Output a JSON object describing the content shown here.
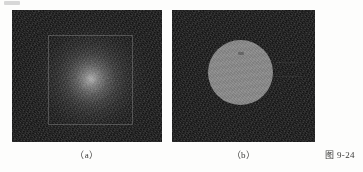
{
  "figure": {
    "number_label": "图 9-24",
    "panels": [
      {
        "id": "a",
        "caption": "（a）",
        "description": "noisy dark image with central radial bright blob and thin square outline",
        "background_color": "#1b1b1b",
        "blob_peak_color": "#b9b9b9",
        "outline_color": "#969696"
      },
      {
        "id": "b",
        "caption": "（b）",
        "description": "noisy dark image with uniform gray circular disc",
        "background_color": "#1b1b1b",
        "disc_color": "#8c8c8c"
      }
    ]
  },
  "chart_data": {
    "type": "heatmap",
    "title": "图 9-24",
    "xlabel": "",
    "ylabel": "",
    "panels": [
      {
        "label": "（a）",
        "kind": "radial-gradient-on-noise",
        "field_background_gray": 27,
        "peak_gray": 185,
        "center_x_frac": 0.52,
        "center_y_frac": 0.52,
        "blob_radius_frac": 0.42,
        "overlay_shape": "square",
        "overlay_x_frac": 0.24,
        "overlay_y_frac": 0.19,
        "overlay_w_frac": 0.57,
        "overlay_h_frac": 0.68
      },
      {
        "label": "（b）",
        "kind": "uniform-disc-on-noise",
        "field_background_gray": 27,
        "disc_gray": 140,
        "center_x_frac": 0.48,
        "center_y_frac": 0.47,
        "disc_radius_frac": 0.23
      }
    ]
  }
}
